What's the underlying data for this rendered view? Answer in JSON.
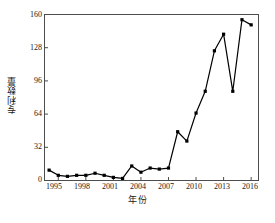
{
  "chart_data": {
    "type": "line",
    "title": "",
    "xlabel": "年份",
    "ylabel": "专利数量",
    "x": [
      1994,
      1995,
      1996,
      1997,
      1998,
      1999,
      2000,
      2001,
      2002,
      2003,
      2004,
      2005,
      2006,
      2007,
      2008,
      2009,
      2010,
      2011,
      2012,
      2013,
      2014,
      2015,
      2016
    ],
    "values": [
      10,
      5,
      4,
      5,
      5,
      7,
      5,
      3,
      2,
      14,
      8,
      12,
      11,
      12,
      47,
      38,
      65,
      86,
      125,
      141,
      86,
      155,
      150
    ],
    "series": [
      {
        "name": "专利数量",
        "values": [
          10,
          5,
          4,
          5,
          5,
          7,
          5,
          3,
          2,
          14,
          8,
          12,
          11,
          12,
          47,
          38,
          65,
          86,
          125,
          141,
          86,
          155,
          150
        ]
      }
    ],
    "xlim": [
      1993.5,
      2016.8
    ],
    "ylim": [
      0,
      160
    ],
    "xticks": [
      1995,
      1998,
      2001,
      2004,
      2007,
      2010,
      2013,
      2016
    ],
    "yticks": [
      0,
      32,
      64,
      96,
      128,
      160
    ],
    "xtick_labels": [
      "1995",
      "1998",
      "2001",
      "2004",
      "2007",
      "2010",
      "2013",
      "2016"
    ],
    "ytick_labels": [
      "0",
      "32",
      "64",
      "96",
      "128",
      "160"
    ],
    "grid": false,
    "legend": null,
    "marker": "square",
    "line_color": "#000000",
    "marker_color": "#000000",
    "axis_color": "#4d4d4d",
    "background": "#ffffff"
  }
}
